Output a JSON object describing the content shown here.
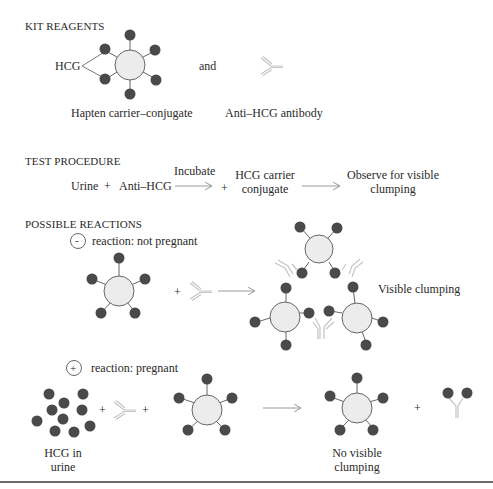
{
  "sections": {
    "kit_reagents": {
      "heading": "KIT REAGENTS",
      "hcg_label": "HCG",
      "and_label": "and",
      "conjugate_caption": "Hapten carrier–conjugate",
      "antibody_caption": "Anti–HCG antibody"
    },
    "test_procedure": {
      "heading": "TEST PROCEDURE",
      "step_urine": "Urine",
      "plus_1": "+",
      "step_anti_hcg": "Anti–HCG",
      "incubate_label": "Incubate",
      "plus_2": "+",
      "step_conjugate_line1": "HCG carrier",
      "step_conjugate_line2": "conjugate",
      "observe_line1": "Observe for visible",
      "observe_line2": "clumping"
    },
    "possible_reactions": {
      "heading": "POSSIBLE REACTIONS",
      "negative": {
        "symbol": "-",
        "label": "reaction: not pregnant",
        "plus": "+",
        "result_label": "Visible clumping"
      },
      "positive": {
        "symbol": "+",
        "label": "reaction: pregnant",
        "plus_1": "+",
        "plus_2": "+",
        "plus_3": "+",
        "hcg_caption_line1": "HCG in",
        "hcg_caption_line2": "urine",
        "result_line1": "No visible",
        "result_line2": "clumping"
      }
    }
  },
  "colors": {
    "hcg_dot": "#4a4a4a",
    "carrier_fill": "#ececec",
    "carrier_stroke": "#555555",
    "antibody": "#c8c8c8",
    "arrow": "#9a9a9a",
    "text": "#2a2a2a"
  }
}
